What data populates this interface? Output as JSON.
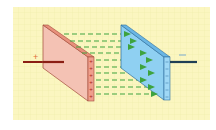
{
  "diagram": {
    "colors": {
      "background": "#fbf6c0",
      "grid": "#efe9a8",
      "positive_plate_face": "#f4c2b4",
      "positive_plate_edge": "#e8907c",
      "positive_outline": "#a24a3a",
      "positive_wire": "#8b1e14",
      "negative_plate_face": "#8fd0f2",
      "negative_plate_edge": "#6ab6e4",
      "negative_outline": "#2e6f9e",
      "negative_wire": "#1f3f55",
      "field_line": "#3ea33e"
    },
    "labels": {
      "positive": "+",
      "negative": "−"
    },
    "positive_plate_charges": [
      "+",
      "+",
      "+",
      "+",
      "+",
      "+"
    ],
    "negative_plate_charges": [
      "−",
      "−",
      "−",
      "−",
      "−",
      "−"
    ],
    "field_line_count": 8
  }
}
